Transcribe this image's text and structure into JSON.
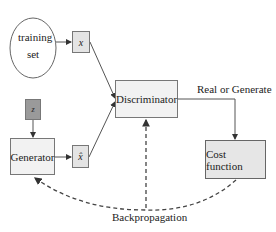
{
  "diagram": {
    "nodes": {
      "training_set": {
        "label_line1": "training",
        "label_line2": "set"
      },
      "x": {
        "label": "x"
      },
      "z": {
        "label": "z"
      },
      "generator": {
        "label": "Generator"
      },
      "x_hat": {
        "label": "x̂"
      },
      "discriminator": {
        "label": "Discriminator"
      },
      "cost_function": {
        "label": "Cost function"
      }
    },
    "edges": {
      "real_or_generate": "Real or Generate",
      "backpropagation": "Backpropagation"
    },
    "colors": {
      "box_fill": "#f2f2f2",
      "small_box_fill": "#e4e4e4",
      "z_fill": "#9a9a9a",
      "cost_fill": "#e6e6e6",
      "line": "#555555"
    }
  }
}
